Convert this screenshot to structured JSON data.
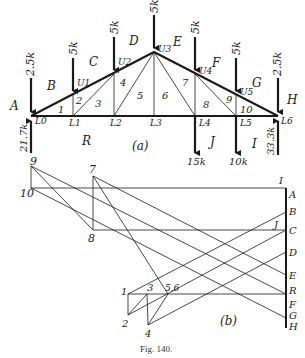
{
  "figure": {
    "caption": "Fig. 140.",
    "part_a_label": "(a)",
    "part_b_label": "(b)"
  },
  "truss": {
    "joints": {
      "L0": {
        "x": 31,
        "y": 116,
        "label": "L0"
      },
      "L1": {
        "x": 73,
        "y": 116,
        "label": "L1"
      },
      "L2": {
        "x": 114,
        "y": 116,
        "label": "L2"
      },
      "L3": {
        "x": 154,
        "y": 116,
        "label": "L3"
      },
      "L4": {
        "x": 195,
        "y": 116,
        "label": "L4"
      },
      "L5": {
        "x": 236,
        "y": 116,
        "label": "L5"
      },
      "L6": {
        "x": 278,
        "y": 116,
        "label": "L6"
      },
      "U1": {
        "x": 73,
        "y": 95,
        "label": "U1"
      },
      "U2": {
        "x": 114,
        "y": 74,
        "label": "U2"
      },
      "U3": {
        "x": 154,
        "y": 52,
        "label": "U3"
      },
      "U4": {
        "x": 195,
        "y": 74,
        "label": "U4"
      },
      "U5": {
        "x": 236,
        "y": 95,
        "label": "U5"
      }
    },
    "loads": [
      {
        "joint": "L0",
        "label": "2.5k",
        "top": 78,
        "dir": "down"
      },
      {
        "joint": "U1",
        "label": "5k",
        "top": 58,
        "dir": "down"
      },
      {
        "joint": "U2",
        "label": "5k",
        "top": 37,
        "dir": "down"
      },
      {
        "joint": "U3",
        "label": "5k",
        "top": 15,
        "dir": "down"
      },
      {
        "joint": "U4",
        "label": "5k",
        "top": 37,
        "dir": "down"
      },
      {
        "joint": "U5",
        "label": "5k",
        "top": 58,
        "dir": "down"
      },
      {
        "joint": "L6",
        "label": "2.5k",
        "top": 78,
        "dir": "down"
      },
      {
        "joint": "L4",
        "label": "15k",
        "bottom": 155,
        "dir": "down"
      },
      {
        "joint": "L5",
        "label": "10k",
        "bottom": 155,
        "dir": "down"
      }
    ],
    "reactions": [
      {
        "joint": "L0",
        "label": "21.7k"
      },
      {
        "joint": "L6",
        "label": "33.3k"
      }
    ],
    "space_labels": [
      "A",
      "B",
      "C",
      "D",
      "E",
      "F",
      "G",
      "H",
      "I",
      "J",
      "R"
    ],
    "panel_numbers": [
      "1",
      "2",
      "3",
      "4",
      "5",
      "6",
      "7",
      "8",
      "9",
      "10"
    ]
  },
  "force_polygon": {
    "load_line_x": 286,
    "load_points": [
      {
        "label": "I",
        "y": 188
      },
      {
        "label": "A",
        "y": 194
      },
      {
        "label": "B",
        "y": 212
      },
      {
        "label": "C",
        "y": 230
      },
      {
        "label": "J",
        "y": 230
      },
      {
        "label": "D",
        "y": 252
      },
      {
        "label": "E",
        "y": 275
      },
      {
        "label": "R",
        "y": 294
      },
      {
        "label": "F",
        "y": 300
      },
      {
        "label": "G",
        "y": 318
      },
      {
        "label": "H",
        "y": 328
      }
    ],
    "nodes": [
      {
        "label": "1",
        "x": 128,
        "y": 294
      },
      {
        "label": "2",
        "x": 128,
        "y": 315
      },
      {
        "label": "3",
        "x": 147,
        "y": 294
      },
      {
        "label": "4",
        "x": 148,
        "y": 325
      },
      {
        "label": "5,6",
        "x": 168,
        "y": 294
      },
      {
        "label": "7",
        "x": 93,
        "y": 176
      },
      {
        "label": "8",
        "x": 93,
        "y": 230
      },
      {
        "label": "9",
        "x": 31,
        "y": 166
      },
      {
        "label": "10",
        "x": 31,
        "y": 188
      }
    ]
  }
}
